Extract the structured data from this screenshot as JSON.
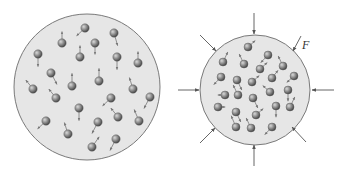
{
  "diagram": {
    "type": "gas-compression",
    "colors": {
      "container_fill": "#e6e6e6",
      "container_stroke": "#7a7a7a",
      "molecule": "#8a8a8a",
      "arrow": "#555555"
    },
    "left_container": {
      "cx": 87,
      "cy": 87,
      "r": 73,
      "molecules": [
        {
          "x": 85,
          "y": 28,
          "dx": -7,
          "dy": 3
        },
        {
          "x": 62,
          "y": 43,
          "dx": 0,
          "dy": -6
        },
        {
          "x": 114,
          "y": 33,
          "dx": 3,
          "dy": 7
        },
        {
          "x": 95,
          "y": 43,
          "dx": 0,
          "dy": 6
        },
        {
          "x": 80,
          "y": 57,
          "dx": 0,
          "dy": -6
        },
        {
          "x": 38,
          "y": 54,
          "dx": 0,
          "dy": 7
        },
        {
          "x": 117,
          "y": 57,
          "dx": 0,
          "dy": 7
        },
        {
          "x": 138,
          "y": 63,
          "dx": 0,
          "dy": -6
        },
        {
          "x": 51,
          "y": 73,
          "dx": 5,
          "dy": 6
        },
        {
          "x": 72,
          "y": 86,
          "dx": 0,
          "dy": -7
        },
        {
          "x": 99,
          "y": 81,
          "dx": 0,
          "dy": -7
        },
        {
          "x": 33,
          "y": 89,
          "dx": -6,
          "dy": -4
        },
        {
          "x": 56,
          "y": 98,
          "dx": -6,
          "dy": -4
        },
        {
          "x": 133,
          "y": 89,
          "dx": -3,
          "dy": -6
        },
        {
          "x": 111,
          "y": 98,
          "dx": -7,
          "dy": 3
        },
        {
          "x": 150,
          "y": 97,
          "dx": -5,
          "dy": 6
        },
        {
          "x": 79,
          "y": 108,
          "dx": 0,
          "dy": 7
        },
        {
          "x": 118,
          "y": 117,
          "dx": -6,
          "dy": -4
        },
        {
          "x": 98,
          "y": 122,
          "dx": -5,
          "dy": 6
        },
        {
          "x": 46,
          "y": 121,
          "dx": -7,
          "dy": 3
        },
        {
          "x": 139,
          "y": 121,
          "dx": -4,
          "dy": -6
        },
        {
          "x": 68,
          "y": 134,
          "dx": -3,
          "dy": -6
        },
        {
          "x": 116,
          "y": 139,
          "dx": -5,
          "dy": 6
        },
        {
          "x": 92,
          "y": 147,
          "dx": 6,
          "dy": -5
        }
      ]
    },
    "right_container": {
      "cx": 255,
      "cy": 90,
      "r": 55,
      "force_label": "F",
      "molecules": [
        {
          "x": 248,
          "y": 47,
          "dx": 6,
          "dy": -2
        },
        {
          "x": 268,
          "y": 55,
          "dx": -6,
          "dy": 3
        },
        {
          "x": 223,
          "y": 62,
          "dx": 4,
          "dy": -5
        },
        {
          "x": 244,
          "y": 64,
          "dx": -4,
          "dy": -5
        },
        {
          "x": 260,
          "y": 69,
          "dx": 6,
          "dy": -2
        },
        {
          "x": 283,
          "y": 66,
          "dx": -4,
          "dy": -5
        },
        {
          "x": 221,
          "y": 77,
          "dx": -6,
          "dy": 3
        },
        {
          "x": 237,
          "y": 80,
          "dx": 4,
          "dy": 5
        },
        {
          "x": 252,
          "y": 82,
          "dx": 6,
          "dy": -2
        },
        {
          "x": 272,
          "y": 78,
          "dx": 5,
          "dy": -3
        },
        {
          "x": 294,
          "y": 76,
          "dx": -6,
          "dy": 2
        },
        {
          "x": 225,
          "y": 95,
          "dx": -6,
          "dy": 0
        },
        {
          "x": 238,
          "y": 95,
          "dx": -4,
          "dy": -5
        },
        {
          "x": 270,
          "y": 92,
          "dx": -6,
          "dy": -2
        },
        {
          "x": 288,
          "y": 90,
          "dx": 0,
          "dy": 6
        },
        {
          "x": 253,
          "y": 98,
          "dx": 4,
          "dy": 5
        },
        {
          "x": 218,
          "y": 107,
          "dx": 6,
          "dy": 0
        },
        {
          "x": 236,
          "y": 112,
          "dx": 4,
          "dy": 5
        },
        {
          "x": 256,
          "y": 115,
          "dx": 6,
          "dy": -2
        },
        {
          "x": 276,
          "y": 106,
          "dx": 0,
          "dy": 6
        },
        {
          "x": 290,
          "y": 107,
          "dx": 4,
          "dy": -5
        },
        {
          "x": 236,
          "y": 127,
          "dx": -4,
          "dy": -6
        },
        {
          "x": 251,
          "y": 128,
          "dx": -4,
          "dy": -5
        },
        {
          "x": 272,
          "y": 127,
          "dx": -6,
          "dy": 3
        }
      ],
      "force_arrows": [
        {
          "x1": 254,
          "y1": 13,
          "x2": 254,
          "y2": 34
        },
        {
          "x1": 301,
          "y1": 36,
          "x2": 293,
          "y2": 51
        },
        {
          "x1": 334,
          "y1": 90,
          "x2": 312,
          "y2": 90
        },
        {
          "x1": 306,
          "y1": 142,
          "x2": 292,
          "y2": 127
        },
        {
          "x1": 254,
          "y1": 166,
          "x2": 254,
          "y2": 145
        },
        {
          "x1": 200,
          "y1": 143,
          "x2": 215,
          "y2": 128
        },
        {
          "x1": 178,
          "y1": 90,
          "x2": 199,
          "y2": 90
        },
        {
          "x1": 200,
          "y1": 35,
          "x2": 216,
          "y2": 51
        }
      ]
    }
  }
}
